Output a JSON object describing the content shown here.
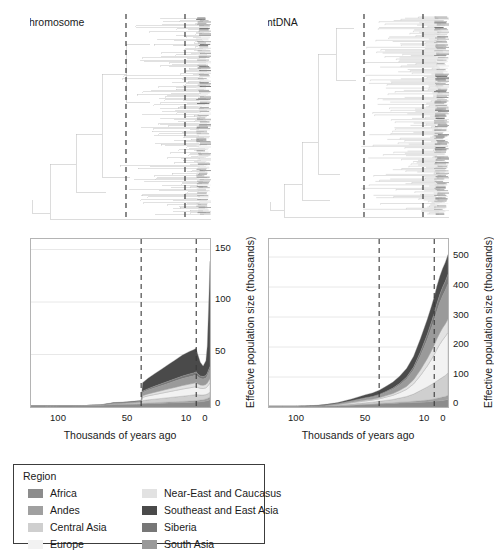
{
  "figure": {
    "panels": [
      {
        "id": "y-chromosome",
        "tree_title": "Y chromosome",
        "chart": {
          "xlabel": "Thousands of years ago",
          "ylabel": "Effective population size (thousands)",
          "xticks": [
            "100",
            "50",
            "10",
            "0"
          ],
          "yticks": [
            "0",
            "50",
            "100",
            "150"
          ],
          "ylim_max": 160,
          "ref_lines": [
            "50",
            "10"
          ]
        }
      },
      {
        "id": "mtdna",
        "tree_title": "mtDNA",
        "chart": {
          "xlabel": "Thousands of years ago",
          "ylabel": "Effective population size (thousands)",
          "xticks": [
            "100",
            "50",
            "10",
            "0"
          ],
          "yticks": [
            "0",
            "100",
            "200",
            "300",
            "400",
            "500"
          ],
          "ylim_max": 560,
          "ref_lines": [
            "50",
            "10"
          ]
        }
      }
    ]
  },
  "legend": {
    "title": "Region",
    "col1": [
      {
        "label": "Africa",
        "color": "#8c8c8c"
      },
      {
        "label": "Andes",
        "color": "#a0a0a0"
      },
      {
        "label": "Central Asia",
        "color": "#cfcfcf"
      },
      {
        "label": "Europe",
        "color": "#f2f2f2"
      }
    ],
    "col2": [
      {
        "label": "Near-East and Caucasus",
        "color": "#e2e2e2"
      },
      {
        "label": "Southeast and East Asia",
        "color": "#4a4a4a"
      },
      {
        "label": "Siberia",
        "color": "#777777"
      },
      {
        "label": "South Asia",
        "color": "#9a9a9a"
      }
    ]
  },
  "chart_data": [
    {
      "type": "area",
      "id": "y-chromosome-skyline",
      "title": "Y chromosome",
      "xlabel": "Thousands of years ago",
      "ylabel": "Effective population size (thousands)",
      "x_axis_reversed": true,
      "xlim": [
        130,
        0
      ],
      "ylim": [
        0,
        160
      ],
      "xticks": [
        100,
        50,
        10,
        0
      ],
      "yticks": [
        0,
        50,
        100,
        150
      ],
      "gridlines": [
        50,
        100,
        150
      ],
      "reference_lines_kya": [
        50,
        10
      ],
      "x": [
        130,
        120,
        110,
        100,
        90,
        80,
        70,
        60,
        55,
        50,
        49,
        45,
        40,
        35,
        30,
        25,
        20,
        15,
        12,
        10,
        9,
        7,
        5,
        3,
        2,
        1,
        0
      ],
      "series": [
        {
          "name": "Africa",
          "color": "#8c8c8c",
          "values": [
            1.2,
            1.2,
            1.3,
            1.3,
            1.4,
            1.6,
            2.4,
            2.6,
            2.7,
            2.8,
            3.0,
            3.2,
            3.4,
            3.6,
            3.8,
            4.0,
            4.2,
            4.4,
            4.6,
            4.7,
            4.8,
            5.0,
            5.2,
            5.6,
            6.0,
            6.4,
            6.8
          ]
        },
        {
          "name": "Andes",
          "color": "#a0a0a0",
          "values": [
            0.0,
            0.0,
            0.0,
            0.0,
            0.0,
            0.0,
            0.1,
            0.1,
            0.2,
            0.2,
            0.5,
            0.6,
            0.7,
            0.8,
            0.9,
            1.0,
            1.1,
            1.2,
            1.3,
            1.4,
            1.5,
            1.6,
            1.8,
            2.0,
            2.2,
            2.4,
            2.6
          ]
        },
        {
          "name": "Central Asia",
          "color": "#cfcfcf",
          "values": [
            0.0,
            0.0,
            0.0,
            0.0,
            0.0,
            0.1,
            0.3,
            0.4,
            0.5,
            0.6,
            2.5,
            3.0,
            3.4,
            3.8,
            4.2,
            4.6,
            5.0,
            5.4,
            5.6,
            5.8,
            5.4,
            4.8,
            4.4,
            4.2,
            4.2,
            4.4,
            4.6
          ]
        },
        {
          "name": "Europe",
          "color": "#f2f2f2",
          "values": [
            0.0,
            0.0,
            0.0,
            0.0,
            0.0,
            0.1,
            0.4,
            0.5,
            0.6,
            0.7,
            3.2,
            3.8,
            4.4,
            5.0,
            5.6,
            6.2,
            6.8,
            7.2,
            7.4,
            7.6,
            7.0,
            6.4,
            6.2,
            6.4,
            7.0,
            8.0,
            9.0
          ]
        },
        {
          "name": "Near-East and Caucasus",
          "color": "#e2e2e2",
          "values": [
            0.0,
            0.0,
            0.0,
            0.0,
            0.0,
            0.0,
            0.2,
            0.3,
            0.3,
            0.4,
            1.6,
            1.9,
            2.2,
            2.5,
            2.8,
            3.1,
            3.4,
            3.6,
            3.7,
            3.8,
            3.5,
            3.2,
            3.1,
            3.2,
            3.4,
            3.8,
            4.2
          ]
        },
        {
          "name": "South Asia",
          "color": "#9a9a9a",
          "values": [
            0.0,
            0.0,
            0.0,
            0.0,
            0.0,
            0.1,
            0.3,
            0.4,
            0.5,
            0.6,
            3.0,
            3.6,
            4.2,
            4.8,
            5.4,
            6.0,
            6.6,
            7.0,
            7.2,
            7.4,
            6.8,
            6.2,
            6.0,
            6.2,
            6.8,
            7.6,
            8.4
          ]
        },
        {
          "name": "Siberia",
          "color": "#777777",
          "values": [
            0.0,
            0.0,
            0.0,
            0.0,
            0.0,
            0.0,
            0.1,
            0.2,
            0.2,
            0.3,
            1.2,
            1.4,
            1.6,
            1.8,
            2.0,
            2.2,
            2.4,
            2.6,
            2.7,
            2.8,
            2.6,
            2.4,
            2.3,
            2.4,
            2.6,
            2.9,
            3.2
          ]
        },
        {
          "name": "Southeast and East Asia",
          "color": "#4a4a4a",
          "values": [
            0.0,
            0.0,
            0.0,
            0.0,
            0.0,
            0.1,
            0.4,
            0.5,
            0.6,
            0.7,
            8.0,
            10.0,
            12.0,
            14.0,
            16.0,
            18.0,
            20.0,
            21.5,
            22.0,
            22.5,
            19.0,
            13.0,
            10.0,
            14.0,
            26.0,
            60.0,
            100.0
          ]
        }
      ],
      "total_peak_kya": 0,
      "total_peak_value": 139
    },
    {
      "type": "area",
      "id": "mtdna-skyline",
      "title": "mtDNA",
      "xlabel": "Thousands of years ago",
      "ylabel": "Effective population size (thousands)",
      "x_axis_reversed": true,
      "xlim": [
        130,
        0
      ],
      "ylim": [
        0,
        560
      ],
      "xticks": [
        100,
        50,
        10,
        0
      ],
      "yticks": [
        0,
        100,
        200,
        300,
        400,
        500
      ],
      "gridlines": [
        100,
        200,
        300,
        400,
        500
      ],
      "reference_lines_kya": [
        50,
        10
      ],
      "x": [
        130,
        120,
        110,
        100,
        90,
        80,
        70,
        60,
        55,
        50,
        45,
        40,
        35,
        30,
        25,
        20,
        15,
        12,
        10,
        8,
        6,
        4,
        2,
        1,
        0
      ],
      "series": [
        {
          "name": "Africa",
          "color": "#8c8c8c",
          "values": [
            2,
            2,
            2,
            3,
            3,
            4,
            6,
            8,
            9,
            10,
            11,
            12,
            13,
            14,
            15,
            16,
            17,
            18,
            19,
            20,
            21,
            22,
            23,
            24,
            25
          ]
        },
        {
          "name": "Andes",
          "color": "#a0a0a0",
          "values": [
            0,
            0,
            0,
            0,
            0,
            0,
            1,
            1,
            1,
            2,
            2,
            2,
            3,
            3,
            4,
            5,
            6,
            7,
            8,
            9,
            10,
            11,
            12,
            13,
            14
          ]
        },
        {
          "name": "Central Asia",
          "color": "#cfcfcf",
          "values": [
            0,
            0,
            0,
            0,
            1,
            2,
            3,
            5,
            6,
            7,
            9,
            11,
            14,
            18,
            24,
            34,
            44,
            50,
            54,
            58,
            62,
            66,
            70,
            72,
            74
          ]
        },
        {
          "name": "Europe",
          "color": "#f2f2f2",
          "values": [
            0,
            0,
            0,
            0,
            1,
            2,
            4,
            6,
            7,
            8,
            11,
            14,
            18,
            24,
            34,
            50,
            70,
            84,
            94,
            106,
            116,
            124,
            130,
            133,
            136
          ]
        },
        {
          "name": "Near-East and Caucasus",
          "color": "#e2e2e2",
          "values": [
            0,
            0,
            0,
            0,
            0,
            1,
            2,
            3,
            3,
            4,
            5,
            6,
            8,
            10,
            14,
            19,
            25,
            29,
            32,
            35,
            38,
            40,
            42,
            43,
            44
          ]
        },
        {
          "name": "South Asia",
          "color": "#9a9a9a",
          "values": [
            0,
            0,
            0,
            0,
            1,
            2,
            4,
            6,
            7,
            8,
            11,
            14,
            18,
            24,
            33,
            47,
            64,
            76,
            84,
            93,
            101,
            107,
            112,
            115,
            118
          ]
        },
        {
          "name": "Siberia",
          "color": "#777777",
          "values": [
            0,
            0,
            0,
            0,
            0,
            1,
            1,
            2,
            2,
            3,
            3,
            4,
            5,
            7,
            9,
            13,
            17,
            20,
            22,
            25,
            27,
            29,
            30,
            31,
            32
          ]
        },
        {
          "name": "Southeast and East Asia",
          "color": "#4a4a4a",
          "values": [
            0,
            0,
            0,
            1,
            2,
            3,
            6,
            10,
            12,
            14,
            17,
            20,
            24,
            29,
            36,
            44,
            50,
            53,
            55,
            58,
            60,
            62,
            63,
            64,
            65
          ]
        }
      ],
      "total_peak_kya": 0,
      "total_peak_value": 527
    }
  ]
}
